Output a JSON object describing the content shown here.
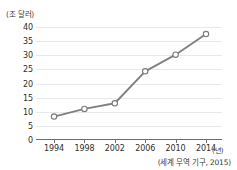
{
  "chart_data": {
    "type": "line",
    "title": "",
    "subtitle": "",
    "xlabel": "(년)",
    "ylabel": "(조 달러)",
    "categories": [
      "1994",
      "1998",
      "2002",
      "2006",
      "2010",
      "2014"
    ],
    "x": [
      1994,
      1998,
      2002,
      2006,
      2010,
      2014
    ],
    "values": [
      8.3,
      11.0,
      13.0,
      24.3,
      30.2,
      37.5
    ],
    "series": [
      {
        "name": "세계 무역액",
        "values": [
          8.3,
          11.0,
          13.0,
          24.3,
          30.2,
          37.5
        ]
      }
    ],
    "ylim": [
      0,
      40
    ],
    "yticks": [
      0,
      5,
      10,
      15,
      20,
      25,
      30,
      35,
      40
    ],
    "ytick_labels": [
      "0",
      "5",
      "10",
      "15",
      "20",
      "25",
      "30",
      "35",
      "40"
    ],
    "xtick_labels": [
      "1994",
      "1998",
      "2002",
      "2006",
      "2010",
      "2014"
    ],
    "grid": true,
    "legend": false,
    "legend_position": "none",
    "annotations": [
      "(세계 무역 기구, 2015)"
    ],
    "source_note": "(세계 무역 기구, 2015)",
    "colors": {
      "line": "#808080",
      "marker_fill": "#ffffff",
      "marker_stroke": "#7a7a7a",
      "gridline": "#e9e9ec",
      "axis": "#6e6e6e",
      "text": "#2e2e2e",
      "background": "#ffffff"
    }
  }
}
